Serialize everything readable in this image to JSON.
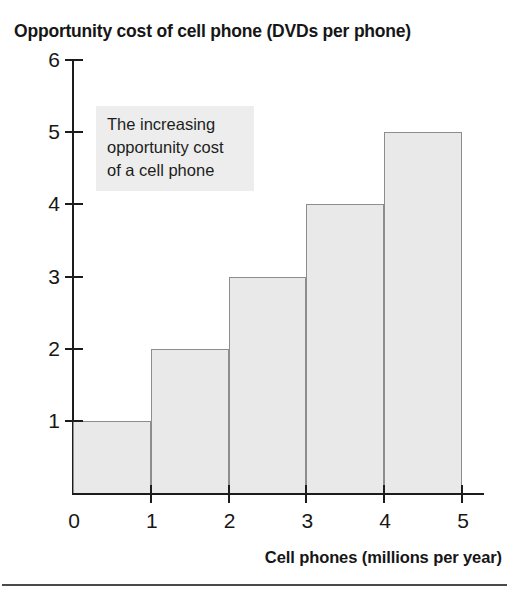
{
  "chart_data": {
    "type": "bar",
    "title": "Opportunity cost of cell phone (DVDs per phone)",
    "xlabel": "Cell phones (millions per year)",
    "ylabel": "Opportunity cost of cell phone (DVDs per phone)",
    "categories": [
      "0–1",
      "1–2",
      "2–3",
      "3–4",
      "4–5"
    ],
    "values": [
      1,
      2,
      3,
      4,
      5
    ],
    "bars": [
      {
        "label": "0–1",
        "x_start": 0,
        "x_end": 1,
        "value": 1
      },
      {
        "label": "1–2",
        "x_start": 1,
        "x_end": 2,
        "value": 2
      },
      {
        "label": "2–3",
        "x_start": 2,
        "x_end": 3,
        "value": 3
      },
      {
        "label": "3–4",
        "x_start": 3,
        "x_end": 4,
        "value": 4
      },
      {
        "label": "4–5",
        "x_start": 4,
        "x_end": 5,
        "value": 5
      }
    ],
    "xlim": [
      0,
      5
    ],
    "ylim": [
      0,
      6
    ],
    "xticks": [
      "0",
      "1",
      "2",
      "3",
      "4",
      "5"
    ],
    "yticks": [
      "1",
      "2",
      "3",
      "4",
      "5",
      "6"
    ],
    "grid": false,
    "legend": null,
    "annotations": [
      {
        "name": "increasing-opportunity-cost-note",
        "lines": [
          "The increasing",
          "opportunity cost",
          "of a cell phone"
        ],
        "position": "upper-left inside plot"
      }
    ],
    "colors": {
      "bar_fill": "#e9e9e9",
      "bar_edge": "#8d8d8d",
      "axis": "#1c1c1c",
      "text": "#161616",
      "annotation_background": "#ededed"
    }
  },
  "yticks": [
    {
      "label": "6",
      "value": 6
    },
    {
      "label": "5",
      "value": 5
    },
    {
      "label": "4",
      "value": 4
    },
    {
      "label": "3",
      "value": 3
    },
    {
      "label": "2",
      "value": 2
    },
    {
      "label": "1",
      "value": 1
    }
  ],
  "xticks": [
    {
      "label": "0",
      "value": 0
    },
    {
      "label": "1",
      "value": 1
    },
    {
      "label": "2",
      "value": 2
    },
    {
      "label": "3",
      "value": 3
    },
    {
      "label": "4",
      "value": 4
    },
    {
      "label": "5",
      "value": 5
    }
  ],
  "annotation": {
    "line1": "The increasing",
    "line2": "opportunity cost",
    "line3": "of a cell phone"
  }
}
